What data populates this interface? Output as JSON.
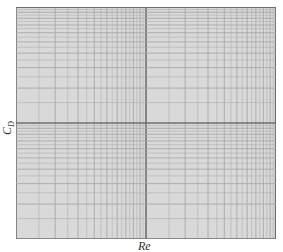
{
  "chart_data": {
    "type": "line",
    "title": "",
    "xlabel": "Re",
    "ylabel": "C_D",
    "ylabel_main": "C",
    "ylabel_sub": "D",
    "x_scale": "log",
    "y_scale": "log",
    "x_decades": 2,
    "y_decades": 2,
    "grid": true,
    "series": [],
    "legend": null,
    "colors": {
      "background": "#d9d9d9",
      "minor_line": "#a8a8a8",
      "major_line": "#6e6e6e",
      "label": "#333333"
    }
  }
}
